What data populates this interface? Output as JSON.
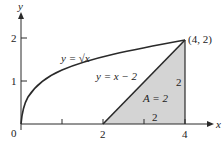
{
  "figure": {
    "axes": {
      "x_label": "x",
      "y_label": "y",
      "origin_label": "0",
      "x_ticks": [
        {
          "value": 1,
          "label": ""
        },
        {
          "value": 2,
          "label": "2"
        },
        {
          "value": 3,
          "label": ""
        },
        {
          "value": 4,
          "label": "4"
        }
      ],
      "y_ticks": [
        {
          "value": 1,
          "label": "1"
        },
        {
          "value": 2,
          "label": "2"
        }
      ]
    },
    "curves": [
      {
        "name": "sqrt",
        "label": "y = √x"
      },
      {
        "name": "line",
        "label": "y = x − 2"
      }
    ],
    "point": {
      "label": "(4, 2)",
      "x": 4,
      "y": 2
    },
    "region": {
      "area_label": "A = 2",
      "base_label": "2",
      "height_label": "2",
      "vertices": [
        [
          2,
          0
        ],
        [
          4,
          0
        ],
        [
          4,
          2
        ]
      ],
      "fill": "#d4d4d4"
    },
    "colors": {
      "stroke": "#2a2a2a",
      "fill": "#d4d4d4",
      "background": "#ffffff"
    }
  }
}
